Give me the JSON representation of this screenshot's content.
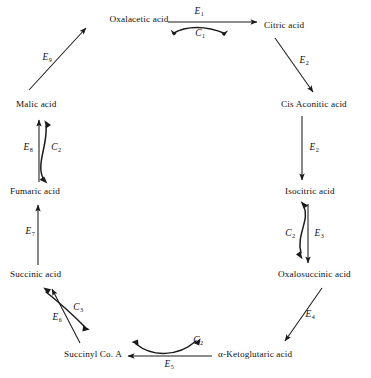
{
  "diagram": {
    "type": "cycle-diagram",
    "stroke_color": "#1a1a1a",
    "background_color": "#ffffff",
    "nodes": [
      {
        "id": "oxalacetic",
        "label": "Oxalacetic acid",
        "x": 139,
        "y": 20,
        "align": "center"
      },
      {
        "id": "citric",
        "label": "Citric acid",
        "x": 264,
        "y": 26,
        "align": "left"
      },
      {
        "id": "cis_aconitic",
        "label": "Cis Aconitic acid",
        "x": 281,
        "y": 105,
        "align": "left"
      },
      {
        "id": "isocitric",
        "label": "Isocitric acid",
        "x": 285,
        "y": 192,
        "align": "left"
      },
      {
        "id": "oxalosuccinic",
        "label": "Oxalosuccinic acid",
        "x": 278,
        "y": 275,
        "align": "left"
      },
      {
        "id": "ketoglutaric",
        "label": "α-Ketoglutaric acid",
        "x": 218,
        "y": 355,
        "align": "left"
      },
      {
        "id": "succinyl_coa",
        "label": "Succinyl Co. A",
        "x": 64,
        "y": 355,
        "align": "left"
      },
      {
        "id": "succinic",
        "label": "Succinic acid",
        "x": 10,
        "y": 275,
        "align": "left"
      },
      {
        "id": "fumaric",
        "label": "Fumaric acid",
        "x": 10,
        "y": 192,
        "align": "left"
      },
      {
        "id": "malic",
        "label": "Malic acid",
        "x": 16,
        "y": 105,
        "align": "left"
      }
    ],
    "enzyme_labels": [
      {
        "id": "E1",
        "text": "E",
        "sub": "1",
        "x": 199,
        "y": 12
      },
      {
        "id": "E2a",
        "text": "E",
        "sub": "2",
        "x": 304,
        "y": 61
      },
      {
        "id": "E2",
        "text": "E",
        "sub": "2",
        "x": 314,
        "y": 148
      },
      {
        "id": "E3",
        "text": "E",
        "sub": "3",
        "x": 319,
        "y": 234
      },
      {
        "id": "E4",
        "text": "E",
        "sub": "4",
        "x": 310,
        "y": 315
      },
      {
        "id": "E5",
        "text": "E",
        "sub": "5",
        "x": 169,
        "y": 365
      },
      {
        "id": "E6",
        "text": "E",
        "sub": "6",
        "x": 57,
        "y": 318
      },
      {
        "id": "E7",
        "text": "E",
        "sub": "7",
        "x": 30,
        "y": 232
      },
      {
        "id": "E8",
        "text": "E",
        "sub": "8",
        "x": 28,
        "y": 148
      },
      {
        "id": "E9",
        "text": "E",
        "sub": "9",
        "x": 47,
        "y": 58
      }
    ],
    "cofactor_labels": [
      {
        "id": "C1",
        "text": "C",
        "sub": "1",
        "x": 200,
        "y": 34
      },
      {
        "id": "C2r",
        "text": "C",
        "sub": "2",
        "x": 290,
        "y": 234
      },
      {
        "id": "C2b",
        "text": "C",
        "sub": "2",
        "x": 198,
        "y": 341
      },
      {
        "id": "C3",
        "text": "C",
        "sub": "3",
        "x": 78,
        "y": 308
      },
      {
        "id": "C2l",
        "text": "C",
        "sub": "2",
        "x": 56,
        "y": 148
      }
    ],
    "edges": [
      {
        "id": "oxalacetic-to-citric",
        "from": "oxalacetic",
        "to": "citric",
        "enzyme": "E1",
        "cofactor": "C1",
        "shape": "straight-horizontal"
      },
      {
        "id": "citric-to-cis-aconitic",
        "from": "citric",
        "to": "cis_aconitic",
        "enzyme": "E2",
        "cofactor": null,
        "shape": "diagonal"
      },
      {
        "id": "cis-aconitic-to-isocitric",
        "from": "cis_aconitic",
        "to": "isocitric",
        "enzyme": "E2",
        "cofactor": null,
        "shape": "straight-vertical"
      },
      {
        "id": "isocitric-to-oxalosuccinic",
        "from": "isocitric",
        "to": "oxalosuccinic",
        "enzyme": "E3",
        "cofactor": "C2",
        "shape": "straight-vertical"
      },
      {
        "id": "oxalosuccinic-to-ketoglutaric",
        "from": "oxalosuccinic",
        "to": "ketoglutaric",
        "enzyme": "E4",
        "cofactor": null,
        "shape": "diagonal"
      },
      {
        "id": "ketoglutaric-to-succinyl",
        "from": "ketoglutaric",
        "to": "succinyl_coa",
        "enzyme": "E5",
        "cofactor": "C2",
        "shape": "straight-horizontal"
      },
      {
        "id": "succinyl-to-succinic",
        "from": "succinyl_coa",
        "to": "succinic",
        "enzyme": "E6",
        "cofactor": "C3",
        "shape": "diagonal"
      },
      {
        "id": "succinic-to-fumaric",
        "from": "succinic",
        "to": "fumaric",
        "enzyme": "E7",
        "cofactor": null,
        "shape": "straight-vertical"
      },
      {
        "id": "fumaric-to-malic",
        "from": "fumaric",
        "to": "malic",
        "enzyme": "E8",
        "cofactor": "C2",
        "shape": "straight-vertical"
      },
      {
        "id": "malic-to-oxalacetic",
        "from": "malic",
        "to": "oxalacetic",
        "enzyme": "E9",
        "cofactor": null,
        "shape": "diagonal"
      }
    ]
  }
}
